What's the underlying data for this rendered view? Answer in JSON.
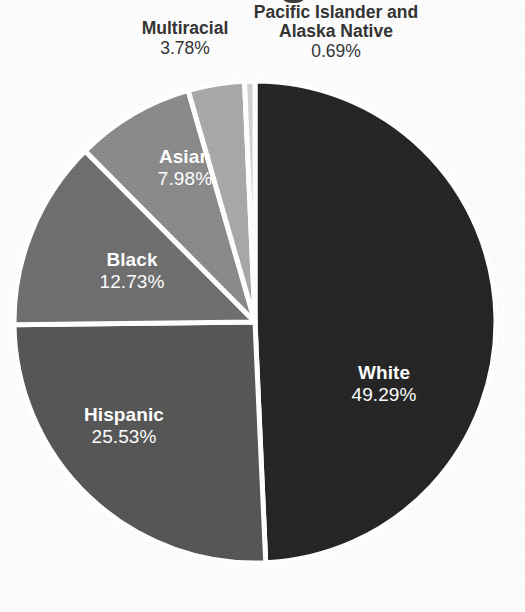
{
  "page": {
    "background_color": "#fdfdfd",
    "kind": "scanned-figure",
    "title_fragment_visible": true
  },
  "chart_data": {
    "type": "pie",
    "title": "",
    "xlabel": "",
    "ylabel": "",
    "legend": "none",
    "labels_position": "on-slice-and-callout",
    "start_angle_deg": 0,
    "direction": "clockwise",
    "categories": [
      "White",
      "Hispanic",
      "Black",
      "Asian",
      "Multiracial",
      "Pacific Islander and Alaska Native"
    ],
    "values": [
      49.29,
      25.53,
      12.73,
      7.98,
      3.78,
      0.69
    ],
    "value_suffix": "%",
    "colors": [
      "#242424",
      "#555555",
      "#6e6e6e",
      "#8a8a8a",
      "#a8a8a8",
      "#d2d2d2"
    ],
    "slice_divider_color": "#ffffff",
    "slices": [
      {
        "name": "White",
        "value": 49.29,
        "value_text": "49.29%",
        "color": "#242424",
        "label_color": "#ffffff",
        "label_placement": "inside"
      },
      {
        "name": "Hispanic",
        "value": 25.53,
        "value_text": "25.53%",
        "color": "#555555",
        "label_color": "#ffffff",
        "label_placement": "inside"
      },
      {
        "name": "Black",
        "value": 12.73,
        "value_text": "12.73%",
        "color": "#6e6e6e",
        "label_color": "#ffffff",
        "label_placement": "inside"
      },
      {
        "name": "Asian",
        "value": 7.98,
        "value_text": "7.98%",
        "color": "#8a8a8a",
        "label_color": "#ffffff",
        "label_placement": "inside"
      },
      {
        "name": "Multiracial",
        "value": 3.78,
        "value_text": "3.78%",
        "color": "#a8a8a8",
        "label_color": "#333333",
        "label_placement": "outside-top"
      },
      {
        "name": "Pacific Islander and Alaska Native",
        "name_line_1": "Pacific Islander and",
        "name_line_2": "Alaska Native",
        "value": 0.69,
        "value_text": "0.69%",
        "color": "#d2d2d2",
        "label_color": "#333333",
        "label_placement": "outside-top"
      }
    ]
  }
}
